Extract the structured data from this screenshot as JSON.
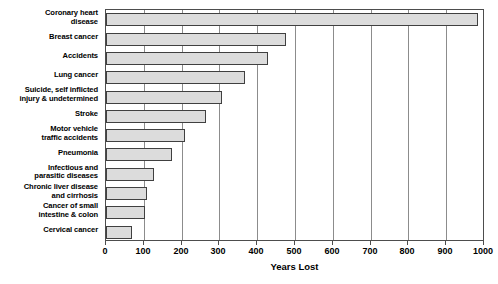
{
  "chart_data": {
    "type": "bar",
    "orientation": "horizontal",
    "title": "",
    "xlabel": "Years Lost",
    "ylabel": "",
    "xlim": [
      0,
      1000
    ],
    "xticks": [
      0,
      100,
      200,
      300,
      400,
      500,
      600,
      700,
      800,
      900,
      1000
    ],
    "xtick_labels": [
      "0",
      "100",
      "200",
      "300",
      "400",
      "500",
      "600",
      "700",
      "800",
      "900",
      "1000"
    ],
    "grid": true,
    "grid_axis": "x",
    "legend": false,
    "categories": [
      "Coronary heart disease",
      "Breast cancer",
      "Accidents",
      "Lung cancer",
      "Suicide, self inflicted injury & undetermined",
      "Stroke",
      "Motor vehicle traffic accidents",
      "Pneumonia",
      "Infectious and parasitic diseases",
      "Chronic liver disease and cirrhosis",
      "Cancer of small intestine & colon",
      "Cervical cancer"
    ],
    "category_lines": [
      [
        "Coronary heart",
        "disease"
      ],
      [
        "Breast cancer"
      ],
      [
        "Accidents"
      ],
      [
        "Lung cancer"
      ],
      [
        "Suicide, self inflicted",
        "injury & undetermined"
      ],
      [
        "Stroke"
      ],
      [
        "Motor vehicle",
        "traffic accidents"
      ],
      [
        "Pneumonia"
      ],
      [
        "Infectious and",
        "parasitic diseases"
      ],
      [
        "Chronic liver disease",
        "and cirrhosis"
      ],
      [
        "Cancer of small",
        "intestine & colon"
      ],
      [
        "Cervical cancer"
      ]
    ],
    "values": [
      985,
      476,
      428,
      368,
      307,
      265,
      209,
      175,
      127,
      108,
      103,
      69
    ],
    "bar_fill": "#dcdcdc",
    "bar_edge": "#404040",
    "grid_color": "#8c8c8c",
    "frame_color": "#4d4d4d"
  }
}
